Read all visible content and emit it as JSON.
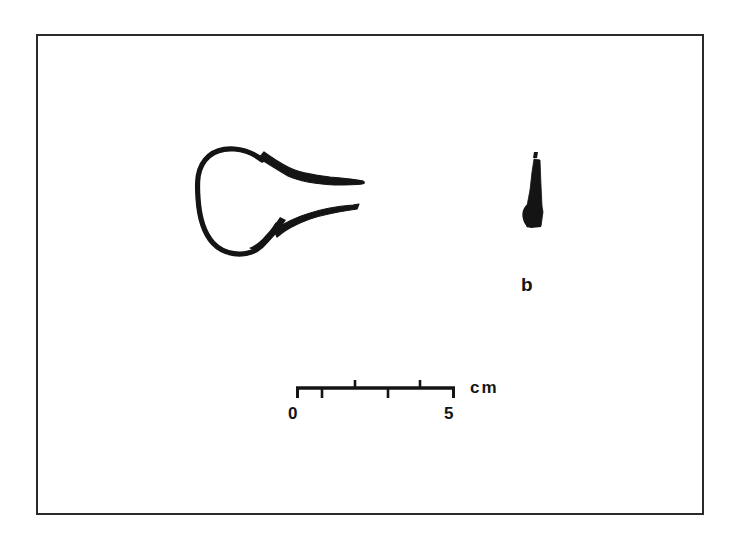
{
  "plate": {
    "background_color": "#ffffff",
    "ink_color": "#141414",
    "frame": {
      "present": true,
      "color": "#2a2a2a",
      "x": 36,
      "y": 34,
      "width": 668,
      "height": 481
    }
  },
  "figures": [
    {
      "id": "artifact-outline-left",
      "name": "loop-and-tines-outline",
      "description": "Open line drawing of a looped object with two tapering arms extending to the right",
      "style": "outline",
      "label": ""
    },
    {
      "id": "artifact-silhouette-right",
      "name": "tapered-blade-silhouette",
      "description": "Solid black narrow tapering blade or point, wider at base",
      "style": "solid",
      "label": "b"
    }
  ],
  "labels": {
    "figure_b": "b"
  },
  "scale_bar": {
    "unit": "cm",
    "min_label": "0",
    "max_label": "5",
    "min_value": 0,
    "max_value": 5,
    "tick_values": [
      0,
      1,
      2,
      3,
      4,
      5
    ],
    "tick_directions": [
      "down",
      "down",
      "up",
      "down",
      "up",
      "down"
    ],
    "bar_color": "#141414"
  }
}
